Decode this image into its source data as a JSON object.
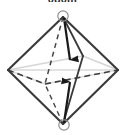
{
  "figure": {
    "title_label": "080m",
    "type": "octahedron-wireframe-diagram",
    "colors": {
      "outline": "#3a3a3a",
      "hidden_edge": "#4a4a4a",
      "pale_edge": "#d4d4d4",
      "arrow": "#1a1a1a",
      "vertex_marker_stroke": "#8a8a8a",
      "background": "#ffffff"
    },
    "vertices": {
      "top": {
        "x": 63,
        "y": 17,
        "marked": true,
        "marker": "circle"
      },
      "bottom": {
        "x": 63,
        "y": 124,
        "marked": true,
        "marker": "circle"
      },
      "left": {
        "x": 8,
        "y": 70,
        "marked": false
      },
      "right": {
        "x": 118,
        "y": 70,
        "marked": false
      },
      "back": {
        "x": 45,
        "y": 84,
        "marked": false
      },
      "front": {
        "x": 83,
        "y": 56,
        "marked": false
      }
    },
    "edges": [
      {
        "name": "top-left-outline",
        "style": "solid"
      },
      {
        "name": "top-right-outline",
        "style": "solid"
      },
      {
        "name": "bottom-left-outline",
        "style": "solid"
      },
      {
        "name": "bottom-right-outline",
        "style": "solid"
      },
      {
        "name": "top-to-front",
        "style": "solid"
      },
      {
        "name": "bottom-to-front",
        "style": "solid"
      },
      {
        "name": "top-to-back",
        "style": "dashed"
      },
      {
        "name": "bottom-to-back",
        "style": "dashed"
      },
      {
        "name": "left-to-back",
        "style": "dashed"
      },
      {
        "name": "right-to-back",
        "style": "dashed"
      },
      {
        "name": "left-to-front",
        "style": "pale"
      },
      {
        "name": "right-to-front",
        "style": "pale"
      },
      {
        "name": "horizontal-axis",
        "style": "pale"
      }
    ],
    "arrows": [
      {
        "name": "downward-arrow",
        "from": "top-vertex",
        "to": "center",
        "direction": "down"
      },
      {
        "name": "upward-arrow",
        "from": "bottom-vertex",
        "to": "center",
        "direction": "up"
      }
    ]
  }
}
